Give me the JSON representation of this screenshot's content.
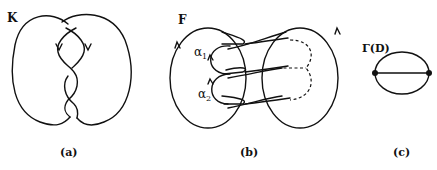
{
  "panels": [
    {
      "id": "a",
      "caption": "(a)",
      "label": "K",
      "description": "knot diagram"
    },
    {
      "id": "b",
      "caption": "(b)",
      "label": "F",
      "arcs": [
        "α",
        "α"
      ],
      "subscripts": [
        "1",
        "2"
      ],
      "description": "Seifert surface with arcs"
    },
    {
      "id": "c",
      "caption": "(c)",
      "label": "Γ(D)",
      "description": "theta graph"
    }
  ]
}
